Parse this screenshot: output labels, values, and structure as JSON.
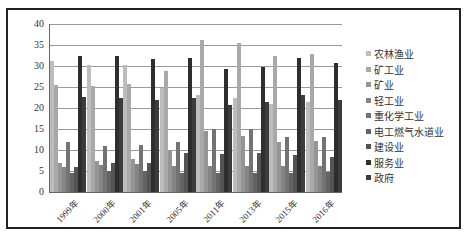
{
  "chart_data": {
    "type": "bar",
    "title": "",
    "xlabel": "",
    "ylabel": "",
    "ylim": [
      0,
      40
    ],
    "yticks": [
      0,
      5,
      10,
      15,
      20,
      25,
      30,
      35,
      40
    ],
    "grid": true,
    "legend_position": "right",
    "categories": [
      "1999年",
      "2000年",
      "2001年",
      "2005年",
      "2011年",
      "2013年",
      "2015年",
      "2016年"
    ],
    "series": [
      {
        "name": "农林渔业",
        "color": "#bdbdbd",
        "values": [
          31.3,
          30.3,
          30.2,
          24.8,
          23.0,
          22.5,
          21.0,
          21.5
        ]
      },
      {
        "name": "矿工业",
        "color": "#a9a9a9",
        "values": [
          25.4,
          25.2,
          25.8,
          28.7,
          36.3,
          35.5,
          32.3,
          32.8
        ]
      },
      {
        "name": "矿业",
        "color": "#959595",
        "values": [
          7.0,
          7.5,
          7.8,
          10.0,
          14.5,
          13.3,
          11.8,
          12.2
        ]
      },
      {
        "name": "轻工业",
        "color": "#858585",
        "values": [
          6.0,
          6.5,
          6.6,
          6.3,
          6.3,
          6.2,
          6.3,
          6.3
        ]
      },
      {
        "name": "重化学工业",
        "color": "#737373",
        "values": [
          12.0,
          11.0,
          11.3,
          12.0,
          15.0,
          15.0,
          13.1,
          13.1
        ]
      },
      {
        "name": "电工燃气水道业",
        "color": "#636363",
        "values": [
          4.5,
          5.0,
          5.0,
          4.5,
          4.5,
          4.5,
          4.5,
          4.8
        ]
      },
      {
        "name": "建设业",
        "color": "#545454",
        "values": [
          6.0,
          7.0,
          7.0,
          9.3,
          9.0,
          9.3,
          8.8,
          8.4
        ]
      },
      {
        "name": "服务业",
        "color": "#2e2e2e",
        "values": [
          32.3,
          32.3,
          31.7,
          31.8,
          29.2,
          29.7,
          31.8,
          30.7
        ]
      },
      {
        "name": "政府",
        "color": "#3c3c3c",
        "values": [
          22.7,
          22.5,
          22.0,
          22.4,
          20.8,
          21.4,
          23.0,
          21.9
        ]
      }
    ]
  }
}
